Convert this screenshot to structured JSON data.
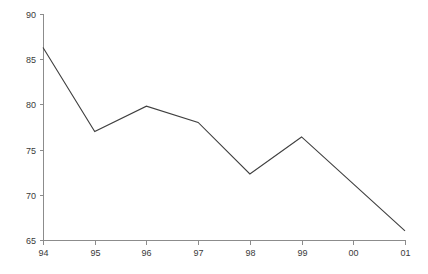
{
  "chart_data": {
    "type": "line",
    "title": "",
    "subtitle": "",
    "xlabel": "",
    "ylabel": "",
    "categories": [
      "94",
      "95",
      "96",
      "97",
      "98",
      "99",
      "00",
      "01"
    ],
    "values": [
      86.3,
      77.0,
      79.8,
      78.0,
      72.3,
      76.4,
      71.2,
      66.0
    ],
    "series": [
      {
        "name": "",
        "values": [
          86.3,
          77.0,
          79.8,
          78.0,
          72.3,
          76.4,
          71.2,
          66.0
        ]
      }
    ],
    "ylim": [
      65,
      90
    ],
    "yticks": [
      65,
      70,
      75,
      80,
      85,
      90
    ],
    "ytick_labels": [
      "65",
      "70",
      "75",
      "80",
      "85",
      "90"
    ],
    "xtick_labels": [
      "94",
      "95",
      "96",
      "97",
      "98",
      "99",
      "00",
      "01"
    ],
    "grid": false,
    "legend": false,
    "legend_position": "none",
    "annotations": [],
    "colors": {
      "line": "#3f3f3f",
      "axis": "#8c8c8c",
      "text": "#3a3a3a",
      "background": "#ffffff"
    }
  },
  "plot_geometry": {
    "left": 43,
    "right": 405,
    "top": 14,
    "bottom": 240
  }
}
